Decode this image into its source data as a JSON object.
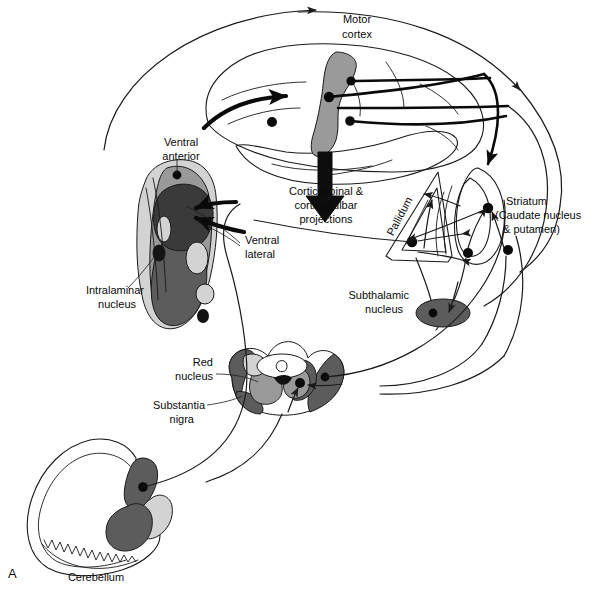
{
  "figure": {
    "panel_letter": "A",
    "domain": "anatomical-schematic"
  },
  "labels": {
    "motor_cortex": "Motor\ncortex",
    "motor_cortex_line1": "Motor",
    "motor_cortex_line2": "cortex",
    "ventral_anterior_line1": "Ventral",
    "ventral_anterior_line2": "anterior",
    "ventral_lateral_line1": "Ventral",
    "ventral_lateral_line2": "lateral",
    "intralaminar_line1": "Intralaminar",
    "intralaminar_line2": "nucleus",
    "corticospinal_line1": "Corticospinal &",
    "corticospinal_line2": "corticobulbar",
    "corticospinal_line3": "projections",
    "pallidum": "Pallidum",
    "striatum_line1": "Striatum",
    "striatum_line2": "(Caudate nucleus",
    "striatum_line3": "& putamen)",
    "subthalamic_line1": "Subthalamic",
    "subthalamic_line2": "nucleus",
    "red_nucleus_line1": "Red",
    "red_nucleus_line2": "nucleus",
    "substantia_nigra_line1": "Substantia",
    "substantia_nigra_line2": "nigra",
    "cerebellum": "Cerebellum"
  },
  "colors": {
    "background": "#ffffff",
    "ink": "#1a1a1a",
    "light_gray": "#d3d3d3",
    "mid_gray": "#9a9a9a",
    "dark_gray": "#5c5c5c",
    "very_dark_gray": "#3a3a3a",
    "near_black": "#141414"
  },
  "structures": [
    {
      "name": "motor-cortex",
      "shade": "mid_gray"
    },
    {
      "name": "cerebral-hemisphere",
      "shade": "white"
    },
    {
      "name": "thalamus",
      "shade": "multi"
    },
    {
      "name": "ventral-anterior-nucleus",
      "shade": "mid_gray"
    },
    {
      "name": "ventral-lateral-nucleus",
      "shade": "very_dark_gray"
    },
    {
      "name": "intralaminar-nucleus",
      "shade": "near_black"
    },
    {
      "name": "pallidum",
      "shade": "white"
    },
    {
      "name": "striatum",
      "shade": "white"
    },
    {
      "name": "subthalamic-nucleus",
      "shade": "dark_gray"
    },
    {
      "name": "midbrain-section",
      "shade": "multi"
    },
    {
      "name": "red-nucleus",
      "shade": "mid_gray"
    },
    {
      "name": "substantia-nigra",
      "shade": "dark_gray"
    },
    {
      "name": "cerebellum",
      "shade": "white"
    },
    {
      "name": "deep-cerebellar-nuclei",
      "shade": "multi"
    }
  ]
}
